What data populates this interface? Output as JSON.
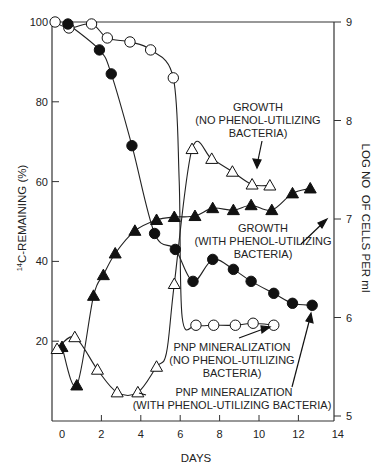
{
  "chart_data": {
    "type": "line",
    "title": "",
    "xlabel": "DAYS",
    "ylabel": "14C-REMAINING (%)",
    "ylabel_sup": "14",
    "ylabel_rest": "C-REMAINING (%)",
    "y2label": "LOG NO  OF CELLS PER ml",
    "xlim": [
      -0.5,
      14
    ],
    "ylim": [
      0,
      100
    ],
    "y2lim": [
      5,
      9
    ],
    "xticks": [
      0,
      2,
      4,
      6,
      8,
      10,
      12,
      14
    ],
    "yticks": [
      20,
      40,
      60,
      80,
      100
    ],
    "y2ticks": [
      5,
      6,
      7,
      8,
      9
    ],
    "grid": false,
    "series": [
      {
        "name": "PNP mineralization (no phenol-utilizing bacteria)",
        "axis": "left",
        "marker": "open-circle",
        "x": [
          -0.35,
          0.35,
          1.5,
          2.3,
          3.45,
          4.5,
          5.65,
          6.8,
          7.7,
          8.8,
          9.7,
          10.75
        ],
        "y": [
          100,
          98.5,
          99.5,
          96,
          95,
          93,
          86,
          24,
          24,
          24,
          24.5,
          24
        ]
      },
      {
        "name": "PNP mineralization (with phenol-utilizing bacteria)",
        "axis": "left",
        "marker": "filled-circle",
        "x": [
          0.3,
          1.9,
          2.5,
          3.55,
          4.7,
          5.75,
          6.65,
          7.65,
          8.7,
          9.6,
          10.75,
          11.7,
          12.7
        ],
        "y": [
          99.5,
          93,
          87,
          69,
          47,
          43,
          35,
          40.5,
          38,
          35,
          32,
          29.5,
          29
        ]
      },
      {
        "name": "Growth (with phenol-utilizing bacteria)",
        "axis": "right",
        "marker": "filled-triangle",
        "x": [
          0,
          0.75,
          1.6,
          2.1,
          2.7,
          3.7,
          4.8,
          5.7,
          6.75,
          7.65,
          8.7,
          9.6,
          10.65,
          11.7,
          12.6
        ],
        "y": [
          5.7,
          5.31,
          6.22,
          6.43,
          6.65,
          6.88,
          6.99,
          7.02,
          7.03,
          7.11,
          7.09,
          7.14,
          7.09,
          7.26,
          7.31
        ]
      },
      {
        "name": "Growth (no phenol-utilizing bacteria)",
        "axis": "right",
        "marker": "open-triangle",
        "x": [
          -0.25,
          0.65,
          1.8,
          2.8,
          3.85,
          4.8,
          5.7,
          6.6,
          7.6,
          8.65,
          9.65,
          10.55
        ],
        "y": [
          5.68,
          5.8,
          5.47,
          5.24,
          5.24,
          5.5,
          6.34,
          7.71,
          7.61,
          7.48,
          7.35,
          7.34
        ]
      }
    ],
    "annotations": [
      {
        "lines": [
          "GROWTH",
          "(NO PHENOL-UTILIZING",
          "BACTERIA)"
        ]
      },
      {
        "lines": [
          "GROWTH",
          "(WITH PHENOL-UTILIZING",
          "BACTERIA)"
        ]
      },
      {
        "lines": [
          "PNP MINERALIZATION",
          "(NO PHENOL-UTILIZING",
          "BACTERIA)"
        ]
      },
      {
        "lines": [
          "PNP MINERALIZATION",
          "(WITH PHENOL-UTILIZING BACTERIA)"
        ]
      }
    ]
  }
}
